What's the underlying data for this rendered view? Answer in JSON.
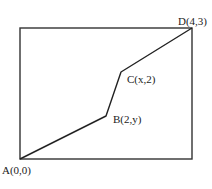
{
  "diagram": {
    "rectangle": {
      "x": 20,
      "y": 28,
      "width": 172,
      "height": 131,
      "stroke": "#333333"
    },
    "path_color": "#222222",
    "points": [
      {
        "id": "A",
        "label": "A(0,0)",
        "px": 20,
        "py": 159,
        "lx": 2,
        "ly": 174
      },
      {
        "id": "B",
        "label": "B(2,y)",
        "px": 106,
        "py": 116,
        "lx": 113,
        "ly": 123
      },
      {
        "id": "C",
        "label": "C(x,2)",
        "px": 121,
        "py": 72,
        "lx": 127,
        "ly": 83
      },
      {
        "id": "D",
        "label": "D(4,3)",
        "px": 192,
        "py": 28,
        "lx": 178,
        "ly": 25
      }
    ]
  }
}
